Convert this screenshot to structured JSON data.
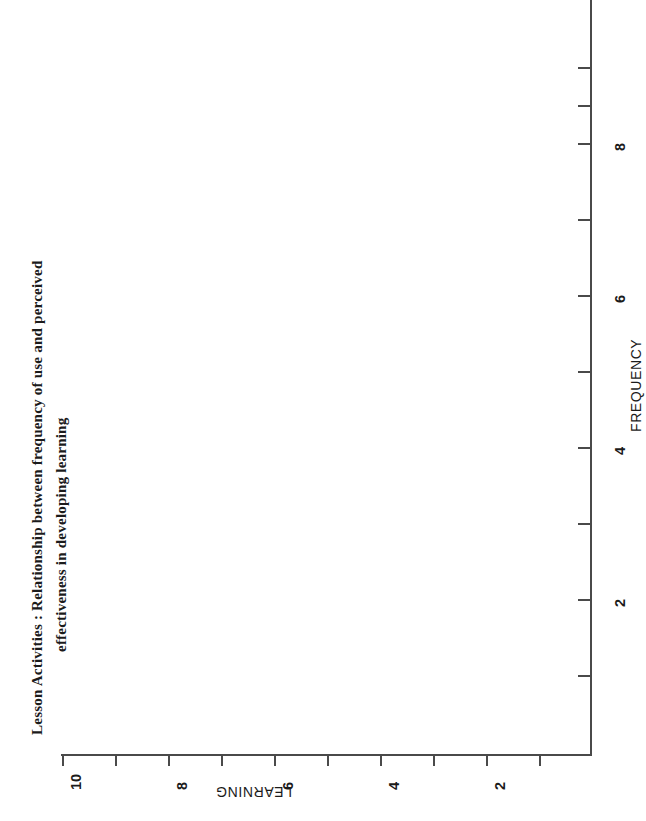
{
  "chart_data": {
    "type": "scatter",
    "title": "Lesson Activities : Relationship between frequency of use and perceived effectiveness in developing learning",
    "title_lines": [
      "Lesson Activities : Relationship between frequency of use and perceived",
      "effectiveness in developing learning"
    ],
    "orientation": "rotated-90-clockwise",
    "xlabel": "FREQUENCY",
    "ylabel": "LEARNING",
    "x": [],
    "y": [],
    "points": [],
    "series": [
      {
        "name": "observations",
        "values": []
      }
    ],
    "xlim": [
      0,
      10
    ],
    "ylim": [
      0,
      10
    ],
    "xticks": [
      2,
      4,
      6,
      8
    ],
    "yticks": [
      2,
      4,
      6,
      8,
      10
    ],
    "x_tick_labels": [
      "2",
      "4",
      "6",
      "8"
    ],
    "y_tick_labels": [
      "2",
      "4",
      "6",
      "8",
      "10"
    ],
    "minor_ticks": true,
    "minor_tick_interval": 1,
    "grid": false,
    "legend": false,
    "legend_position": "none",
    "annotations": [],
    "note": "Axes are drawn with no plotted data markers visible in this figure."
  },
  "axes": {
    "learning": {
      "title": "LEARNING",
      "ticks": [
        {
          "label": "10",
          "value": 10,
          "px": 62,
          "major": true
        },
        {
          "label": "",
          "value": 9,
          "px": 115,
          "major": false
        },
        {
          "label": "8",
          "value": 8,
          "px": 168,
          "major": true
        },
        {
          "label": "",
          "value": 7,
          "px": 221,
          "major": false
        },
        {
          "label": "6",
          "value": 6,
          "px": 274,
          "major": true
        },
        {
          "label": "",
          "value": 5,
          "px": 327,
          "major": false
        },
        {
          "label": "4",
          "value": 4,
          "px": 380,
          "major": true
        },
        {
          "label": "",
          "value": 3,
          "px": 433,
          "major": false
        },
        {
          "label": "2",
          "value": 2,
          "px": 486,
          "major": true
        },
        {
          "label": "",
          "value": 1,
          "px": 539,
          "major": false
        }
      ]
    },
    "frequency": {
      "title": "FREQUENCY",
      "ticks": [
        {
          "label": "",
          "value": 10,
          "px": 67,
          "major": false
        },
        {
          "label": "",
          "value": 9,
          "px": 105,
          "major": false
        },
        {
          "label": "8",
          "value": 8,
          "px": 143,
          "major": true
        },
        {
          "label": "",
          "value": 7,
          "px": 219,
          "major": false
        },
        {
          "label": "6",
          "value": 6,
          "px": 295,
          "major": true
        },
        {
          "label": "",
          "value": 5,
          "px": 371,
          "major": false
        },
        {
          "label": "4",
          "value": 4,
          "px": 447,
          "major": true
        },
        {
          "label": "",
          "value": 3,
          "px": 523,
          "major": false
        },
        {
          "label": "2",
          "value": 2,
          "px": 599,
          "major": true
        },
        {
          "label": "",
          "value": 1,
          "px": 675,
          "major": false
        }
      ]
    }
  },
  "colors": {
    "background": "#ffffff",
    "axis": "#4a4a4a",
    "text": "#1b1b1b",
    "marker": "#1b1b1b"
  }
}
